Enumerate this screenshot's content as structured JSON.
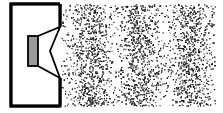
{
  "diagram": {
    "speaker": {
      "box_stroke": "#000000",
      "magnet_fill": "#999999"
    },
    "wave": {
      "compression_bands": 3,
      "band_centers_x": [
        90,
        140,
        190
      ],
      "particle_color": "#1a1a1a",
      "background": "#ffffff"
    }
  }
}
